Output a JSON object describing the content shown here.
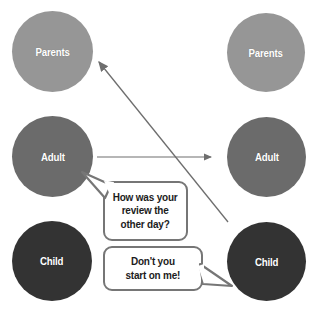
{
  "diagram": {
    "background_color": "#ffffff",
    "width": 312,
    "height": 312
  },
  "colors": {
    "parents": "#969696",
    "adult": "#6b6b6b",
    "child": "#333333",
    "label_text": "#ffffff",
    "bubble_fill": "#ffffff",
    "bubble_border": "#767676",
    "bubble_text": "#1c1c1c",
    "arrow": "#6e6e6e"
  },
  "columns": [
    {
      "name": "left-person",
      "states": [
        {
          "id": "parents",
          "label": "Parents"
        },
        {
          "id": "adult",
          "label": "Adult"
        },
        {
          "id": "child",
          "label": "Child"
        }
      ]
    },
    {
      "name": "right-person",
      "states": [
        {
          "id": "parents",
          "label": "Parents"
        },
        {
          "id": "adult",
          "label": "Adult"
        },
        {
          "id": "child",
          "label": "Child"
        }
      ]
    }
  ],
  "arrows": [
    {
      "id": "adult-to-adult",
      "from": "left-adult",
      "to": "right-adult",
      "direction": "right",
      "x1": 97,
      "y1": 157,
      "x2": 214,
      "y2": 157
    },
    {
      "id": "child-to-parents",
      "from": "right-child",
      "to": "left-parents",
      "direction": "up-left",
      "x1": 228,
      "y1": 222,
      "x2": 96,
      "y2": 59
    }
  ],
  "bubbles": [
    {
      "id": "question",
      "speaker": "left-adult",
      "lines": [
        "How was your",
        "review the",
        "other day?"
      ],
      "text": "How was your review the other day?",
      "tail_direction": "up-left"
    },
    {
      "id": "reply",
      "speaker": "right-child",
      "lines": [
        "Don't you",
        "start on me!"
      ],
      "text": "Don't you start on me!",
      "tail_direction": "right"
    }
  ]
}
